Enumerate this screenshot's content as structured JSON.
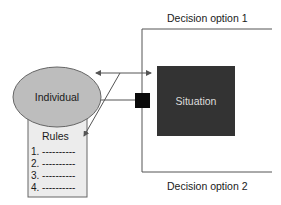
{
  "diagram": {
    "decision_option_1": "Decision option 1",
    "decision_option_2": "Decision option 2",
    "individual": "Individual",
    "situation": "Situation",
    "rules": {
      "title": "Rules",
      "items": [
        "1. ----------",
        "2. ----------",
        "3. ----------",
        "4. ----------"
      ]
    },
    "colors": {
      "individual_fill": "#bdbdbd",
      "rules_fill": "#ececec",
      "situation_fill": "#333333",
      "connector_square": "#0a0a0a",
      "line": "#555555"
    }
  }
}
